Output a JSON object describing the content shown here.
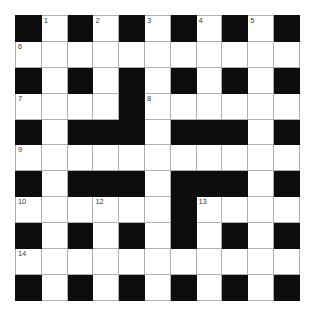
{
  "puzzle": {
    "type": "crossword-grid",
    "title": "Crossword Puzzle Grid",
    "rows": 11,
    "columns": 11,
    "colors": {
      "block": "#0d0d0d",
      "cell": "#ffffff",
      "grid_line": "#b0b0b0",
      "number_text": "#3a3a3a",
      "background": "#ffffff"
    },
    "legend": {
      "black_symbol": "#",
      "white_symbol": "."
    },
    "grid": [
      [
        "#",
        ".",
        "#",
        ".",
        "#",
        ".",
        "#",
        ".",
        "#",
        ".",
        "#"
      ],
      [
        ".",
        ".",
        ".",
        ".",
        ".",
        ".",
        ".",
        ".",
        ".",
        ".",
        "."
      ],
      [
        "#",
        ".",
        "#",
        ".",
        "#",
        ".",
        "#",
        ".",
        "#",
        ".",
        "#"
      ],
      [
        ".",
        ".",
        ".",
        ".",
        "#",
        ".",
        ".",
        ".",
        ".",
        ".",
        "."
      ],
      [
        "#",
        ".",
        "#",
        "#",
        "#",
        ".",
        "#",
        "#",
        "#",
        ".",
        "#"
      ],
      [
        ".",
        ".",
        ".",
        ".",
        ".",
        ".",
        ".",
        ".",
        ".",
        ".",
        "."
      ],
      [
        "#",
        ".",
        "#",
        "#",
        "#",
        ".",
        "#",
        "#",
        "#",
        ".",
        "#"
      ],
      [
        ".",
        ".",
        ".",
        ".",
        ".",
        ".",
        "#",
        ".",
        ".",
        ".",
        "."
      ],
      [
        "#",
        ".",
        "#",
        ".",
        "#",
        ".",
        "#",
        ".",
        "#",
        ".",
        "#"
      ],
      [
        ".",
        ".",
        ".",
        ".",
        ".",
        ".",
        ".",
        ".",
        ".",
        ".",
        "."
      ],
      [
        "#",
        ".",
        "#",
        ".",
        "#",
        ".",
        "#",
        ".",
        "#",
        ".",
        "#"
      ]
    ],
    "numbers": [
      {
        "row": 0,
        "col": 1,
        "label": "1"
      },
      {
        "row": 0,
        "col": 3,
        "label": "2"
      },
      {
        "row": 0,
        "col": 5,
        "label": "3"
      },
      {
        "row": 0,
        "col": 7,
        "label": "4"
      },
      {
        "row": 0,
        "col": 9,
        "label": "5"
      },
      {
        "row": 1,
        "col": 0,
        "label": "6"
      },
      {
        "row": 3,
        "col": 0,
        "label": "7"
      },
      {
        "row": 3,
        "col": 5,
        "label": "8"
      },
      {
        "row": 5,
        "col": 0,
        "label": "9"
      },
      {
        "row": 7,
        "col": 0,
        "label": "10"
      },
      {
        "row": 7,
        "col": 3,
        "label": "12"
      },
      {
        "row": 7,
        "col": 7,
        "label": "13"
      },
      {
        "row": 9,
        "col": 0,
        "label": "14"
      }
    ]
  }
}
